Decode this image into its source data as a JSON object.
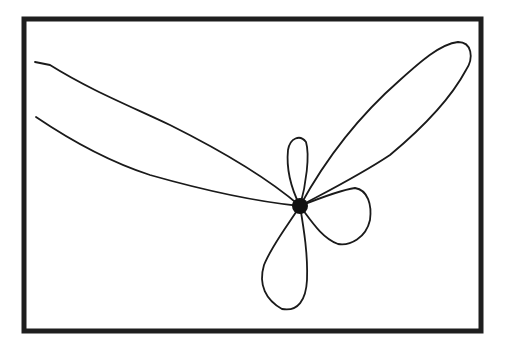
{
  "figure": {
    "frame": {
      "x": 24,
      "y": 19,
      "width": 457,
      "height": 312,
      "stroke": "#1e1e1e"
    },
    "center": {
      "cx": 300,
      "cy": 206,
      "r": 8,
      "fill": "#111111"
    },
    "petals": [
      {
        "name": "long-upper-left",
        "direction": "upper-left",
        "extends_past_left_edge": true
      },
      {
        "name": "long-upper-right",
        "direction": "upper-right"
      },
      {
        "name": "small-top",
        "direction": "up"
      },
      {
        "name": "right",
        "direction": "right"
      },
      {
        "name": "bottom",
        "direction": "down"
      }
    ],
    "line_color": "#1a1a1a",
    "background": "#ffffff"
  }
}
